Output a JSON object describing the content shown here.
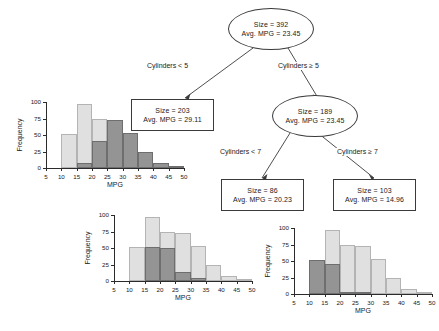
{
  "figure": {
    "type": "regression-tree-with-histograms",
    "colors": {
      "base_fill": "#e0e0e0",
      "base_stroke": "#b4b4b4",
      "subset_fill": "#949494",
      "subset_stroke": "#6e6e6e",
      "node_stroke": "#3a3a3a",
      "text": "#1a1a1a"
    }
  },
  "tree": {
    "nodes": [
      {
        "id": "root",
        "shape": "ellipse",
        "size_label": "Size = 392",
        "mpg_label": "Avg. MPG = 23.45",
        "size": 392,
        "avg_mpg": 23.45
      },
      {
        "id": "left-leaf",
        "shape": "box",
        "size_label": "Size = 203",
        "mpg_label": "Avg. MPG = 29.11",
        "size": 203,
        "avg_mpg": 29.11
      },
      {
        "id": "right-internal",
        "shape": "ellipse",
        "size_label": "Size = 189",
        "mpg_label": "Avg. MPG = 23.45",
        "size": 189,
        "avg_mpg": 23.45
      },
      {
        "id": "mid-leaf",
        "shape": "box",
        "size_label": "Size = 86",
        "mpg_label": "Avg. MPG = 20.23",
        "size": 86,
        "avg_mpg": 20.23
      },
      {
        "id": "right-leaf",
        "shape": "box",
        "size_label": "Size = 103",
        "mpg_label": "Avg. MPG = 14.96",
        "size": 103,
        "avg_mpg": 14.96
      }
    ],
    "branch_labels": [
      {
        "id": "split1-left",
        "text": "Cylinders < 5"
      },
      {
        "id": "split1-right",
        "text": "Cylinders ≥ 5"
      },
      {
        "id": "split2-left",
        "text": "Cylinders < 7"
      },
      {
        "id": "split2-right",
        "text": "Cylinders ≥ 7"
      }
    ]
  },
  "chart_data": [
    {
      "id": "hist-left-leaf",
      "type": "bar",
      "title": "",
      "xlabel": "MPG",
      "ylabel": "Frequency",
      "xlim": [
        5,
        50
      ],
      "ylim": [
        0,
        100
      ],
      "xticks": [
        5,
        10,
        15,
        20,
        25,
        30,
        35,
        40,
        45,
        50
      ],
      "yticks": [
        0,
        25,
        50,
        75,
        100
      ],
      "bin_width": 5,
      "bin_starts": [
        5,
        10,
        15,
        20,
        25,
        30,
        35,
        40,
        45
      ],
      "grid": false,
      "legend": "none",
      "series": [
        {
          "name": "All observations",
          "values": [
            0,
            51,
            97,
            74,
            73,
            53,
            25,
            7,
            2
          ]
        },
        {
          "name": "Node subset (Cylinders < 5)",
          "values": [
            0,
            0,
            7,
            41,
            73,
            53,
            25,
            7,
            2
          ]
        }
      ]
    },
    {
      "id": "hist-mid-leaf",
      "type": "bar",
      "title": "",
      "xlabel": "MPG",
      "ylabel": "Frequency",
      "xlim": [
        5,
        50
      ],
      "ylim": [
        0,
        100
      ],
      "xticks": [
        5,
        10,
        15,
        20,
        25,
        30,
        35,
        40,
        45,
        50
      ],
      "yticks": [
        0,
        25,
        50,
        75,
        100
      ],
      "bin_width": 5,
      "bin_starts": [
        5,
        10,
        15,
        20,
        25,
        30,
        35,
        40,
        45
      ],
      "grid": false,
      "legend": "none",
      "series": [
        {
          "name": "All observations",
          "values": [
            0,
            51,
            97,
            74,
            73,
            53,
            25,
            7,
            2
          ]
        },
        {
          "name": "Node subset (Cylinders 5-6)",
          "values": [
            0,
            0,
            51,
            50,
            14,
            4,
            0,
            0,
            0
          ]
        }
      ]
    },
    {
      "id": "hist-right-leaf",
      "type": "bar",
      "title": "",
      "xlabel": "MPG",
      "ylabel": "Frequency",
      "xlim": [
        5,
        50
      ],
      "ylim": [
        0,
        100
      ],
      "xticks": [
        5,
        10,
        15,
        20,
        25,
        30,
        35,
        40,
        45,
        50
      ],
      "yticks": [
        0,
        25,
        50,
        75,
        100
      ],
      "bin_width": 5,
      "bin_starts": [
        5,
        10,
        15,
        20,
        25,
        30,
        35,
        40,
        45
      ],
      "grid": false,
      "legend": "none",
      "series": [
        {
          "name": "All observations",
          "values": [
            0,
            51,
            97,
            74,
            73,
            53,
            25,
            7,
            2
          ]
        },
        {
          "name": "Node subset (Cylinders ≥ 7)",
          "values": [
            0,
            51,
            45,
            3,
            1,
            0,
            0,
            0,
            0
          ]
        }
      ]
    }
  ]
}
